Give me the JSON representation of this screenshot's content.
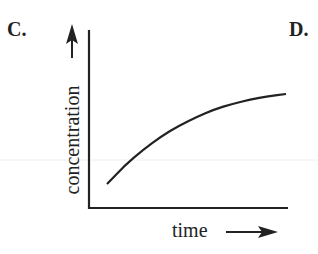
{
  "panels": {
    "left_label": "C.",
    "right_label": "D."
  },
  "chart_data": {
    "type": "line",
    "title": "",
    "xlabel": "time",
    "ylabel": "concentration",
    "xlim": [
      0,
      1
    ],
    "ylim": [
      0,
      1
    ],
    "grid": false,
    "legend": null,
    "ticks": {
      "x": [],
      "y": []
    },
    "series": [
      {
        "name": "concentration",
        "x": [
          0.0,
          0.1,
          0.2,
          0.3,
          0.4,
          0.5,
          0.6,
          0.7,
          0.8,
          0.9,
          1.0
        ],
        "y": [
          0.0,
          0.17,
          0.31,
          0.43,
          0.53,
          0.61,
          0.68,
          0.73,
          0.77,
          0.8,
          0.82
        ]
      }
    ],
    "annotations": [
      "axis arrows indicate increasing concentration and time"
    ]
  }
}
